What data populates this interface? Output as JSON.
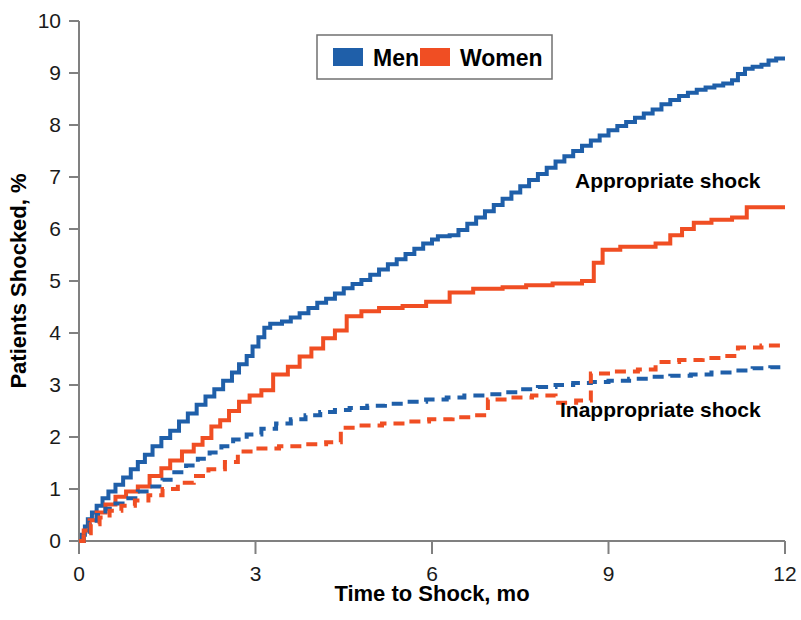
{
  "chart_data": {
    "type": "line",
    "title": "",
    "xlabel": "Time to Shock, mo",
    "ylabel": "Patients Shocked, %",
    "xlim": [
      0,
      12
    ],
    "ylim": [
      0,
      10
    ],
    "xticks": [
      0,
      3,
      6,
      9,
      12
    ],
    "yticks": [
      0,
      1,
      2,
      3,
      4,
      5,
      6,
      7,
      8,
      9,
      10
    ],
    "grid": false,
    "legend": {
      "position": "top-center",
      "entries": [
        {
          "label": "Men",
          "color": "#1F5FA9"
        },
        {
          "label": "Women",
          "color": "#F04E23"
        }
      ]
    },
    "annotations": [
      {
        "text": "Appropriate shock",
        "x": 9.6,
        "y": 6.95
      },
      {
        "text": "Inappropriate shock",
        "x": 9.6,
        "y": 2.55
      }
    ],
    "series": [
      {
        "name": "Men appropriate shock",
        "color": "#1F5FA9",
        "dash": "solid",
        "group": "appropriate",
        "points": [
          [
            0.0,
            0.0
          ],
          [
            0.05,
            0.12
          ],
          [
            0.1,
            0.28
          ],
          [
            0.15,
            0.42
          ],
          [
            0.22,
            0.55
          ],
          [
            0.3,
            0.68
          ],
          [
            0.4,
            0.82
          ],
          [
            0.5,
            0.95
          ],
          [
            0.62,
            1.08
          ],
          [
            0.75,
            1.22
          ],
          [
            0.88,
            1.38
          ],
          [
            1.0,
            1.52
          ],
          [
            1.12,
            1.66
          ],
          [
            1.25,
            1.82
          ],
          [
            1.4,
            1.98
          ],
          [
            1.55,
            2.12
          ],
          [
            1.7,
            2.3
          ],
          [
            1.85,
            2.45
          ],
          [
            2.0,
            2.62
          ],
          [
            2.15,
            2.78
          ],
          [
            2.3,
            2.92
          ],
          [
            2.45,
            3.08
          ],
          [
            2.6,
            3.24
          ],
          [
            2.72,
            3.4
          ],
          [
            2.85,
            3.56
          ],
          [
            2.95,
            3.74
          ],
          [
            3.05,
            3.92
          ],
          [
            3.15,
            4.1
          ],
          [
            3.25,
            4.18
          ],
          [
            3.45,
            4.22
          ],
          [
            3.6,
            4.3
          ],
          [
            3.75,
            4.38
          ],
          [
            3.9,
            4.48
          ],
          [
            4.05,
            4.58
          ],
          [
            4.2,
            4.66
          ],
          [
            4.35,
            4.76
          ],
          [
            4.5,
            4.86
          ],
          [
            4.65,
            4.94
          ],
          [
            4.8,
            5.02
          ],
          [
            4.95,
            5.12
          ],
          [
            5.1,
            5.22
          ],
          [
            5.25,
            5.32
          ],
          [
            5.4,
            5.42
          ],
          [
            5.55,
            5.52
          ],
          [
            5.7,
            5.62
          ],
          [
            5.85,
            5.72
          ],
          [
            6.0,
            5.8
          ],
          [
            6.1,
            5.86
          ],
          [
            6.3,
            5.88
          ],
          [
            6.45,
            5.98
          ],
          [
            6.6,
            6.1
          ],
          [
            6.75,
            6.22
          ],
          [
            6.9,
            6.34
          ],
          [
            7.05,
            6.46
          ],
          [
            7.2,
            6.58
          ],
          [
            7.35,
            6.7
          ],
          [
            7.5,
            6.82
          ],
          [
            7.65,
            6.94
          ],
          [
            7.8,
            7.06
          ],
          [
            7.95,
            7.18
          ],
          [
            8.1,
            7.3
          ],
          [
            8.25,
            7.4
          ],
          [
            8.4,
            7.5
          ],
          [
            8.55,
            7.6
          ],
          [
            8.7,
            7.7
          ],
          [
            8.85,
            7.8
          ],
          [
            9.0,
            7.9
          ],
          [
            9.15,
            7.98
          ],
          [
            9.3,
            8.06
          ],
          [
            9.45,
            8.14
          ],
          [
            9.6,
            8.22
          ],
          [
            9.75,
            8.3
          ],
          [
            9.9,
            8.4
          ],
          [
            10.05,
            8.48
          ],
          [
            10.2,
            8.56
          ],
          [
            10.35,
            8.62
          ],
          [
            10.5,
            8.68
          ],
          [
            10.65,
            8.72
          ],
          [
            10.8,
            8.76
          ],
          [
            10.95,
            8.8
          ],
          [
            11.1,
            8.86
          ],
          [
            11.2,
            8.98
          ],
          [
            11.32,
            9.08
          ],
          [
            11.45,
            9.12
          ],
          [
            11.6,
            9.16
          ],
          [
            11.72,
            9.24
          ],
          [
            11.85,
            9.28
          ],
          [
            12.0,
            9.28
          ]
        ]
      },
      {
        "name": "Women appropriate shock",
        "color": "#F04E23",
        "dash": "solid",
        "group": "appropriate",
        "points": [
          [
            0.0,
            0.0
          ],
          [
            0.08,
            0.2
          ],
          [
            0.18,
            0.4
          ],
          [
            0.3,
            0.55
          ],
          [
            0.45,
            0.7
          ],
          [
            0.62,
            0.85
          ],
          [
            0.8,
            0.95
          ],
          [
            1.0,
            1.05
          ],
          [
            1.2,
            1.25
          ],
          [
            1.4,
            1.4
          ],
          [
            1.55,
            1.55
          ],
          [
            1.75,
            1.72
          ],
          [
            1.95,
            1.85
          ],
          [
            2.1,
            1.98
          ],
          [
            2.25,
            2.2
          ],
          [
            2.4,
            2.32
          ],
          [
            2.55,
            2.5
          ],
          [
            2.72,
            2.68
          ],
          [
            2.9,
            2.8
          ],
          [
            3.1,
            2.9
          ],
          [
            3.3,
            3.2
          ],
          [
            3.55,
            3.35
          ],
          [
            3.75,
            3.55
          ],
          [
            3.95,
            3.7
          ],
          [
            4.15,
            3.9
          ],
          [
            4.35,
            4.05
          ],
          [
            4.55,
            4.32
          ],
          [
            4.8,
            4.42
          ],
          [
            5.1,
            4.48
          ],
          [
            5.5,
            4.52
          ],
          [
            5.9,
            4.6
          ],
          [
            6.3,
            4.78
          ],
          [
            6.7,
            4.85
          ],
          [
            7.2,
            4.88
          ],
          [
            7.6,
            4.92
          ],
          [
            8.05,
            4.95
          ],
          [
            8.55,
            5.0
          ],
          [
            8.75,
            5.35
          ],
          [
            8.9,
            5.6
          ],
          [
            9.2,
            5.66
          ],
          [
            9.8,
            5.72
          ],
          [
            10.05,
            5.88
          ],
          [
            10.25,
            6.0
          ],
          [
            10.45,
            6.12
          ],
          [
            10.75,
            6.18
          ],
          [
            11.1,
            6.22
          ],
          [
            11.35,
            6.42
          ],
          [
            12.0,
            6.42
          ]
        ]
      },
      {
        "name": "Men inappropriate shock",
        "color": "#1F5FA9",
        "dash": "dashed",
        "group": "inappropriate",
        "points": [
          [
            0.0,
            0.0
          ],
          [
            0.08,
            0.18
          ],
          [
            0.18,
            0.35
          ],
          [
            0.3,
            0.5
          ],
          [
            0.45,
            0.62
          ],
          [
            0.62,
            0.72
          ],
          [
            0.8,
            0.82
          ],
          [
            1.0,
            0.95
          ],
          [
            1.2,
            1.05
          ],
          [
            1.42,
            1.18
          ],
          [
            1.62,
            1.32
          ],
          [
            1.82,
            1.45
          ],
          [
            2.02,
            1.58
          ],
          [
            2.22,
            1.7
          ],
          [
            2.42,
            1.82
          ],
          [
            2.62,
            1.95
          ],
          [
            2.85,
            2.05
          ],
          [
            3.1,
            2.16
          ],
          [
            3.35,
            2.26
          ],
          [
            3.6,
            2.34
          ],
          [
            3.85,
            2.42
          ],
          [
            4.1,
            2.48
          ],
          [
            4.35,
            2.52
          ],
          [
            4.6,
            2.56
          ],
          [
            4.9,
            2.6
          ],
          [
            5.2,
            2.64
          ],
          [
            5.55,
            2.68
          ],
          [
            5.9,
            2.72
          ],
          [
            6.25,
            2.76
          ],
          [
            6.55,
            2.8
          ],
          [
            6.9,
            2.82
          ],
          [
            7.25,
            2.86
          ],
          [
            7.5,
            2.92
          ],
          [
            7.8,
            2.96
          ],
          [
            8.1,
            3.0
          ],
          [
            8.4,
            3.04
          ],
          [
            8.7,
            3.06
          ],
          [
            9.0,
            3.08
          ],
          [
            9.35,
            3.12
          ],
          [
            9.7,
            3.16
          ],
          [
            10.05,
            3.18
          ],
          [
            10.4,
            3.2
          ],
          [
            10.75,
            3.24
          ],
          [
            11.1,
            3.28
          ],
          [
            11.45,
            3.32
          ],
          [
            11.75,
            3.34
          ],
          [
            12.0,
            3.34
          ]
        ]
      },
      {
        "name": "Women inappropriate shock",
        "color": "#F04E23",
        "dash": "dashed",
        "group": "inappropriate",
        "points": [
          [
            0.0,
            0.0
          ],
          [
            0.08,
            0.15
          ],
          [
            0.2,
            0.32
          ],
          [
            0.35,
            0.45
          ],
          [
            0.52,
            0.58
          ],
          [
            0.72,
            0.68
          ],
          [
            0.95,
            0.78
          ],
          [
            1.18,
            0.88
          ],
          [
            1.42,
            1.0
          ],
          [
            1.68,
            1.12
          ],
          [
            1.95,
            1.25
          ],
          [
            2.2,
            1.38
          ],
          [
            2.48,
            1.52
          ],
          [
            2.7,
            1.72
          ],
          [
            3.0,
            1.78
          ],
          [
            3.4,
            1.82
          ],
          [
            3.8,
            1.86
          ],
          [
            4.2,
            1.9
          ],
          [
            4.45,
            2.18
          ],
          [
            4.75,
            2.22
          ],
          [
            5.15,
            2.26
          ],
          [
            5.55,
            2.3
          ],
          [
            5.95,
            2.34
          ],
          [
            6.35,
            2.38
          ],
          [
            6.7,
            2.42
          ],
          [
            6.95,
            2.72
          ],
          [
            7.3,
            2.76
          ],
          [
            7.7,
            2.8
          ],
          [
            8.1,
            2.66
          ],
          [
            8.45,
            2.7
          ],
          [
            8.7,
            3.22
          ],
          [
            9.1,
            3.26
          ],
          [
            9.5,
            3.3
          ],
          [
            9.8,
            3.44
          ],
          [
            10.2,
            3.48
          ],
          [
            10.6,
            3.52
          ],
          [
            10.95,
            3.56
          ],
          [
            11.2,
            3.72
          ],
          [
            11.6,
            3.76
          ],
          [
            12.0,
            3.76
          ]
        ]
      }
    ]
  },
  "axes": {
    "x_title": "Time to Shock, mo",
    "y_title": "Patients Shocked, %",
    "x_tick_labels": [
      "0",
      "3",
      "6",
      "9",
      "12"
    ],
    "y_tick_labels": [
      "0",
      "1",
      "2",
      "3",
      "4",
      "5",
      "6",
      "7",
      "8",
      "9",
      "10"
    ]
  },
  "legend": {
    "men_label": "Men",
    "women_label": "Women",
    "men_color": "#1F5FA9",
    "women_color": "#F04E23"
  },
  "annotations": {
    "appropriate": "Appropriate shock",
    "inappropriate": "Inappropriate shock"
  }
}
